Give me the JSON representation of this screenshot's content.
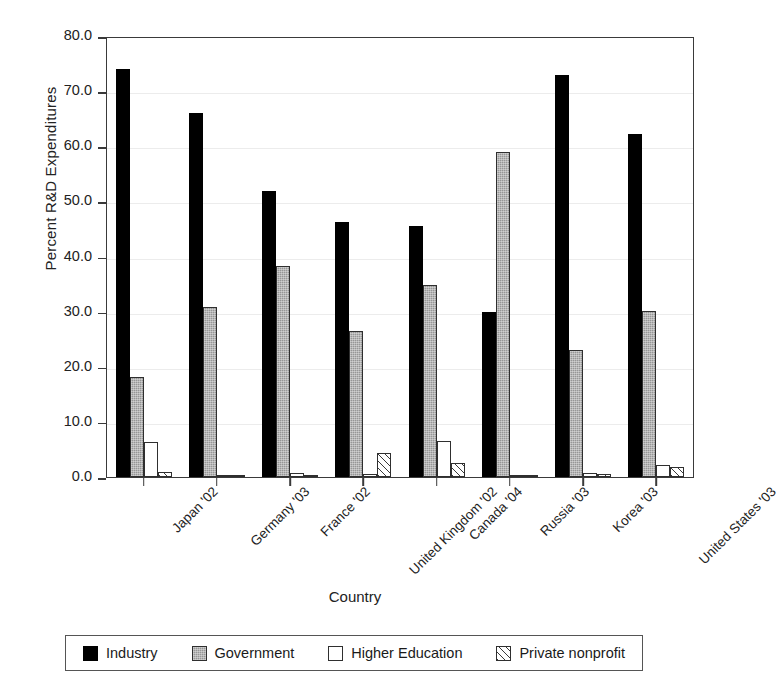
{
  "chart_data": {
    "type": "bar",
    "title": "",
    "xlabel": "Country",
    "ylabel": "Percent R&D Expenditures",
    "ylim": [
      0,
      80
    ],
    "ytick_step": 10,
    "ytick_labels": [
      "0.0",
      "10.0",
      "20.0",
      "30.0",
      "40.0",
      "50.0",
      "60.0",
      "70.0",
      "80.0"
    ],
    "grid": true,
    "legend_position": "bottom",
    "categories": [
      "Japan '02",
      "Germany '03",
      "France '02",
      "United Kingdom '02",
      "Canada '04",
      "Russia '03",
      "Korea '03",
      "United States '03"
    ],
    "series": [
      {
        "name": "Industry",
        "color": "#000000",
        "fill": "solid",
        "values": [
          74.0,
          66.0,
          51.8,
          46.3,
          45.6,
          30.0,
          73.0,
          62.2
        ]
      },
      {
        "name": "Government",
        "color": "#969696",
        "fill": "dotted",
        "values": [
          18.1,
          30.9,
          38.2,
          26.4,
          34.8,
          59.0,
          23.1,
          30.2
        ]
      },
      {
        "name": "Higher Education",
        "color": "#ffffff",
        "fill": "open",
        "values": [
          6.3,
          0.4,
          0.7,
          0.5,
          6.6,
          0.4,
          0.7,
          2.2
        ]
      },
      {
        "name": "Private nonprofit",
        "color": "#ffffff",
        "fill": "hatch",
        "values": [
          1.0,
          0.2,
          0.4,
          4.4,
          2.5,
          0.3,
          0.5,
          1.9
        ]
      }
    ]
  },
  "legend": {
    "items": [
      {
        "label": "Industry"
      },
      {
        "label": "Government"
      },
      {
        "label": "Higher Education"
      },
      {
        "label": "Private nonprofit"
      }
    ]
  }
}
